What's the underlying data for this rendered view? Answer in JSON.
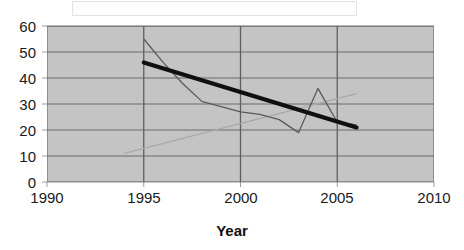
{
  "chart_data": {
    "type": "line",
    "title": "",
    "xlabel": "Year",
    "ylabel": "",
    "xlim": [
      1990,
      2010
    ],
    "ylim": [
      0,
      60
    ],
    "xticks": [
      1990,
      1995,
      2000,
      2005,
      2010
    ],
    "yticks": [
      0,
      10,
      20,
      30,
      40,
      50,
      60
    ],
    "grid": true,
    "legend": "none",
    "plot_background": "#c4c4c4",
    "series": [
      {
        "name": "data",
        "style": "thin-dark-line",
        "color": "#555555",
        "x": [
          1995,
          1996,
          1997,
          1998,
          1999,
          2000,
          2001,
          2002,
          2003,
          2004,
          2005,
          2006
        ],
        "values": [
          55,
          46,
          38,
          31,
          29,
          27,
          26,
          24,
          19,
          36,
          23,
          22
        ]
      },
      {
        "name": "trend",
        "style": "thick-black-line",
        "color": "#101010",
        "x": [
          1995,
          2006
        ],
        "values": [
          46,
          21
        ]
      },
      {
        "name": "faint-rising",
        "style": "faint-gray-line",
        "color": "#a8a8a8",
        "x": [
          1994,
          2006
        ],
        "values": [
          11,
          34
        ]
      }
    ]
  },
  "axes": {
    "y_tick_labels": [
      "60",
      "50",
      "40",
      "30",
      "20",
      "10",
      "0"
    ],
    "x_tick_labels": [
      "1990",
      "1995",
      "2000",
      "2005",
      "2010"
    ],
    "x_axis_title": "Year"
  }
}
